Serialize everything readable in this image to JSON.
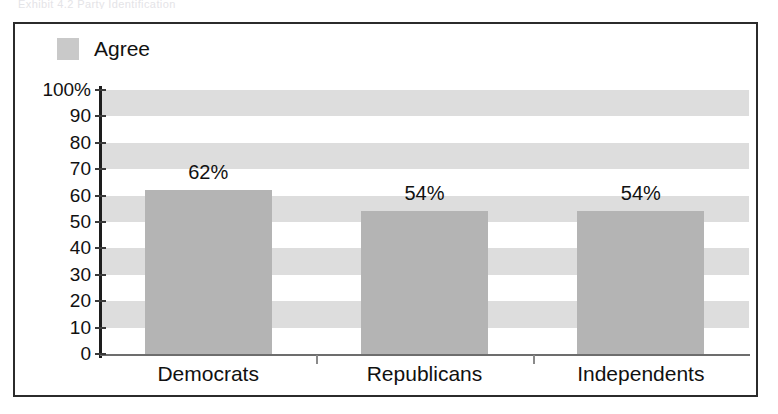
{
  "scan_artifact": {
    "top_cut_text": "Exhibit  4.2   Party  Identification"
  },
  "chart_data": {
    "type": "bar",
    "title": "",
    "subtitle": "",
    "xlabel": "",
    "ylabel": "",
    "categories": [
      "Democrats",
      "Republicans",
      "Independents"
    ],
    "values": [
      62,
      54,
      54
    ],
    "value_labels": [
      "62%",
      "54%",
      "54%"
    ],
    "series": [
      {
        "name": "Agree",
        "values": [
          62,
          54,
          54
        ]
      }
    ],
    "ylim": [
      0,
      100
    ],
    "yticks": [
      0,
      10,
      20,
      30,
      40,
      50,
      60,
      70,
      80,
      90,
      100
    ],
    "ytick_labels": [
      "0",
      "10",
      "20",
      "30",
      "40",
      "50",
      "60",
      "70",
      "80",
      "90",
      "100%"
    ],
    "grid": "horizontal-bands",
    "legend": {
      "position": "top-left",
      "entries": [
        "Agree"
      ]
    }
  },
  "legend": {
    "entries": [
      {
        "label": "Agree",
        "swatch_color": "#c9c9c9"
      }
    ]
  },
  "colors": {
    "bar_fill": "#b4b4b4",
    "band_fill": "#dddddd",
    "plot_background": "#ffffff",
    "frame_border": "#2b2b2b",
    "axis": "#1d1d1d",
    "text": "#111111"
  }
}
